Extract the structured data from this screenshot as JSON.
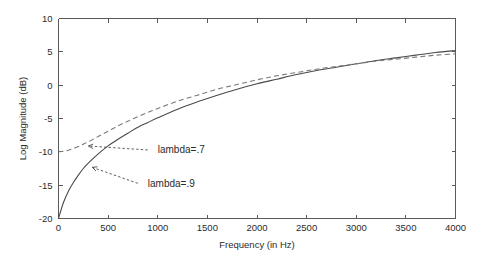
{
  "chart_data": {
    "type": "line",
    "title": "",
    "xlabel": "Frequency (in Hz)",
    "ylabel": "Log Magnitude (dB)",
    "xlim": [
      0,
      4000
    ],
    "ylim": [
      -20,
      10
    ],
    "xticks": [
      0,
      500,
      1000,
      1500,
      2000,
      2500,
      3000,
      3500,
      4000
    ],
    "xticklabels": [
      "0",
      "500",
      "1000",
      "1500",
      "2000",
      "2500",
      "3000",
      "3500",
      "4000"
    ],
    "yticks": [
      -20,
      -15,
      -10,
      -5,
      0,
      5,
      10
    ],
    "yticklabels": [
      "-20",
      "-15",
      "-10",
      "-5",
      "0",
      "5",
      "10"
    ],
    "grid": false,
    "legend_position": "none",
    "series": [
      {
        "name": "lambda=.9",
        "style": "solid",
        "color": "#4a4a4a",
        "x": [
          0,
          50,
          100,
          150,
          200,
          250,
          300,
          400,
          500,
          600,
          700,
          800,
          900,
          1000,
          1200,
          1400,
          1600,
          1800,
          2000,
          2200,
          2400,
          2600,
          2800,
          3000,
          3200,
          3400,
          3600,
          3800,
          4000
        ],
        "y": [
          -20.0,
          -17.6,
          -15.9,
          -14.6,
          -13.5,
          -12.5,
          -11.7,
          -10.3,
          -9.1,
          -8.1,
          -7.2,
          -6.3,
          -5.6,
          -4.9,
          -3.6,
          -2.5,
          -1.5,
          -0.6,
          0.2,
          0.9,
          1.6,
          2.2,
          2.7,
          3.2,
          3.7,
          4.1,
          4.5,
          4.9,
          5.2
        ]
      },
      {
        "name": "lambda=.7",
        "style": "dashed",
        "color": "#7a7a7a",
        "x": [
          0,
          50,
          100,
          150,
          200,
          250,
          300,
          400,
          500,
          600,
          700,
          800,
          900,
          1000,
          1200,
          1400,
          1600,
          1800,
          2000,
          2200,
          2400,
          2600,
          2800,
          3000,
          3200,
          3400,
          3600,
          3800,
          4000
        ],
        "y": [
          -10.0,
          -9.9,
          -9.75,
          -9.5,
          -9.2,
          -8.85,
          -8.5,
          -7.7,
          -6.9,
          -6.1,
          -5.4,
          -4.7,
          -4.1,
          -3.5,
          -2.4,
          -1.5,
          -0.6,
          0.1,
          0.8,
          1.4,
          1.9,
          2.4,
          2.8,
          3.2,
          3.6,
          3.9,
          4.2,
          4.5,
          4.7
        ]
      }
    ],
    "annotations": [
      {
        "label": "<---- lambda=.7",
        "text": "lambda=.7",
        "arrow": "<----",
        "points_to_series": "lambda=.7",
        "x_text": 1000,
        "y_text": -10.2
      },
      {
        "label": "<-- lambda=.9",
        "text": "lambda=.9",
        "arrow": "<--",
        "points_to_series": "lambda=.9",
        "x_text": 900,
        "y_text": -15.2
      }
    ]
  },
  "figure": {
    "background_color": "#ffffff",
    "axis_color": "#5a5a5a"
  }
}
